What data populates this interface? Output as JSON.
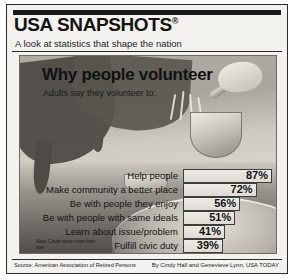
{
  "masthead": {
    "title": "USA SNAPSHOTS",
    "registered_mark": "®",
    "tagline": "A look at statistics that shape the nation"
  },
  "illustration": {
    "description": "soup-kitchen-volunteers-serving",
    "icons": [
      "ladle-icon",
      "pot-icon",
      "steam-icon",
      "bowl-icon",
      "hand-icon"
    ]
  },
  "chart_data": {
    "type": "bar",
    "orientation": "horizontal",
    "title": "Why people volunteer",
    "subtitle": "Adults say they volunteer to:",
    "xlabel": "",
    "ylabel": "",
    "xlim": [
      0,
      100
    ],
    "grid": false,
    "legend": false,
    "value_suffix": "%",
    "categories": [
      "Help people",
      "Make community a better place",
      "Be with people they enjoy",
      "Be with people with same ideals",
      "Learn about issue/problem",
      "Fulfill civic duty"
    ],
    "values": [
      87,
      72,
      56,
      51,
      41,
      39
    ],
    "labels": [
      "87%",
      "72%",
      "56%",
      "51%",
      "41%",
      "39%"
    ],
    "note": "Note: Could name more than one"
  },
  "footer": {
    "source": "Source: American Association of Retired Persons",
    "credit": "By Cindy Hall and Genevieve Lynn, USA TODAY"
  }
}
